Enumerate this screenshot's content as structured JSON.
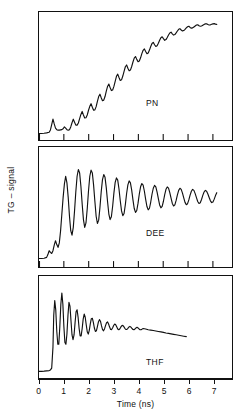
{
  "figure": {
    "ylabel": "TG – signal",
    "xlabel": "Time (ns)",
    "xticks": [
      "0",
      "1",
      "2",
      "3",
      "4",
      "5",
      "6",
      "7"
    ],
    "panels": [
      {
        "id": "pn",
        "label": "PN"
      },
      {
        "id": "dee",
        "label": "DEE"
      },
      {
        "id": "thf",
        "label": "THF"
      }
    ],
    "stroke_color": "#111111",
    "background_color": "#ffffff"
  },
  "chart_data": [
    {
      "type": "line",
      "title": "PN",
      "xlabel": "Time (ns)",
      "ylabel": "TG – signal",
      "xlim": [
        0,
        7.6
      ],
      "ylim": [
        0,
        1
      ],
      "grid": false,
      "legend": null,
      "annotations": [
        "PN"
      ],
      "description": "Transient grating signal in propionitrile: slow sigmoidal rise with superimposed damped acoustic oscillations reaching plateau near 6 ns.",
      "oscillation_period_ns": 0.33,
      "series": [
        {
          "name": "PN",
          "x": [
            0.0,
            0.1,
            0.2,
            0.3,
            0.4,
            0.45,
            0.5,
            0.55,
            0.6,
            0.65,
            0.7,
            0.75,
            0.8,
            0.85,
            0.9,
            0.95,
            1.0,
            1.05,
            1.1,
            1.15,
            1.2,
            1.25,
            1.3,
            1.35,
            1.4,
            1.45,
            1.5,
            1.55,
            1.6,
            1.65,
            1.7,
            1.75,
            1.8,
            1.85,
            1.9,
            1.95,
            2.0,
            2.05,
            2.1,
            2.15,
            2.2,
            2.25,
            2.3,
            2.35,
            2.4,
            2.45,
            2.5,
            2.55,
            2.6,
            2.65,
            2.7,
            2.75,
            2.8,
            2.85,
            2.9,
            2.95,
            3.0,
            3.05,
            3.1,
            3.15,
            3.2,
            3.25,
            3.3,
            3.35,
            3.4,
            3.45,
            3.5,
            3.55,
            3.6,
            3.65,
            3.7,
            3.75,
            3.8,
            3.85,
            3.9,
            3.95,
            4.0,
            4.05,
            4.1,
            4.15,
            4.2,
            4.25,
            4.3,
            4.35,
            4.4,
            4.45,
            4.5,
            4.55,
            4.6,
            4.65,
            4.7,
            4.75,
            4.8,
            4.85,
            4.9,
            4.95,
            5.0,
            5.05,
            5.1,
            5.15,
            5.2,
            5.25,
            5.3,
            5.35,
            5.4,
            5.45,
            5.5,
            5.55,
            5.6,
            5.65,
            5.7,
            5.75,
            5.8,
            5.85,
            5.9,
            5.95,
            6.0,
            6.05,
            6.1,
            6.15,
            6.2,
            6.25,
            6.3,
            6.35,
            6.4,
            6.45,
            6.5,
            6.55,
            6.6,
            6.65,
            6.7,
            6.75,
            6.8,
            6.85,
            6.9,
            6.95,
            7.0,
            7.05,
            7.1
          ],
          "y": [
            0.03,
            0.03,
            0.032,
            0.035,
            0.04,
            0.06,
            0.105,
            0.15,
            0.11,
            0.075,
            0.062,
            0.058,
            0.058,
            0.06,
            0.062,
            0.07,
            0.085,
            0.075,
            0.062,
            0.058,
            0.062,
            0.085,
            0.12,
            0.15,
            0.125,
            0.1,
            0.1,
            0.118,
            0.155,
            0.19,
            0.215,
            0.185,
            0.16,
            0.162,
            0.185,
            0.225,
            0.258,
            0.28,
            0.25,
            0.225,
            0.228,
            0.255,
            0.3,
            0.34,
            0.36,
            0.33,
            0.305,
            0.31,
            0.34,
            0.385,
            0.425,
            0.445,
            0.415,
            0.39,
            0.395,
            0.425,
            0.468,
            0.51,
            0.528,
            0.5,
            0.475,
            0.48,
            0.512,
            0.552,
            0.59,
            0.605,
            0.578,
            0.556,
            0.562,
            0.592,
            0.63,
            0.662,
            0.676,
            0.652,
            0.632,
            0.638,
            0.665,
            0.7,
            0.728,
            0.74,
            0.718,
            0.7,
            0.706,
            0.73,
            0.76,
            0.785,
            0.795,
            0.775,
            0.76,
            0.766,
            0.788,
            0.812,
            0.834,
            0.842,
            0.826,
            0.812,
            0.818,
            0.836,
            0.856,
            0.874,
            0.88,
            0.866,
            0.856,
            0.86,
            0.874,
            0.89,
            0.904,
            0.91,
            0.898,
            0.89,
            0.894,
            0.904,
            0.916,
            0.926,
            0.93,
            0.92,
            0.914,
            0.916,
            0.924,
            0.932,
            0.94,
            0.942,
            0.934,
            0.93,
            0.932,
            0.938,
            0.944,
            0.95,
            0.95,
            0.944,
            0.94,
            0.942,
            0.946,
            0.95,
            0.952,
            0.948,
            0.946
          ]
        }
      ]
    },
    {
      "type": "line",
      "title": "DEE",
      "xlabel": "Time (ns)",
      "ylabel": "TG – signal",
      "xlim": [
        0,
        7.6
      ],
      "ylim": [
        0,
        1
      ],
      "grid": false,
      "legend": null,
      "annotations": [
        "DEE"
      ],
      "description": "Transient grating signal in diethyl ether: fast rise near 0.8 ns to a large-amplitude oscillatory plateau with slowly damping acoustic oscillations persisting to 7 ns.",
      "oscillation_period_ns": 0.33,
      "series": [
        {
          "name": "DEE",
          "x": [
            0.0,
            0.1,
            0.2,
            0.3,
            0.35,
            0.4,
            0.45,
            0.5,
            0.55,
            0.6,
            0.65,
            0.7,
            0.75,
            0.8,
            0.85,
            0.9,
            0.95,
            1.0,
            1.05,
            1.1,
            1.15,
            1.2,
            1.25,
            1.3,
            1.35,
            1.4,
            1.45,
            1.5,
            1.55,
            1.6,
            1.65,
            1.7,
            1.75,
            1.8,
            1.85,
            1.9,
            1.95,
            2.0,
            2.05,
            2.1,
            2.15,
            2.2,
            2.25,
            2.3,
            2.35,
            2.4,
            2.45,
            2.5,
            2.55,
            2.6,
            2.65,
            2.7,
            2.75,
            2.8,
            2.85,
            2.9,
            2.95,
            3.0,
            3.05,
            3.1,
            3.15,
            3.2,
            3.25,
            3.3,
            3.35,
            3.4,
            3.45,
            3.5,
            3.55,
            3.6,
            3.65,
            3.7,
            3.75,
            3.8,
            3.85,
            3.9,
            3.95,
            4.0,
            4.05,
            4.1,
            4.15,
            4.2,
            4.25,
            4.3,
            4.35,
            4.4,
            4.45,
            4.5,
            4.55,
            4.6,
            4.65,
            4.7,
            4.75,
            4.8,
            4.85,
            4.9,
            4.95,
            5.0,
            5.05,
            5.1,
            5.15,
            5.2,
            5.25,
            5.3,
            5.35,
            5.4,
            5.45,
            5.5,
            5.55,
            5.6,
            5.65,
            5.7,
            5.75,
            5.8,
            5.85,
            5.9,
            5.95,
            6.0,
            6.05,
            6.1,
            6.15,
            6.2,
            6.25,
            6.3,
            6.35,
            6.4,
            6.45,
            6.5,
            6.55,
            6.6,
            6.65,
            6.7,
            6.75,
            6.8,
            6.85,
            6.9,
            6.95,
            7.0,
            7.05
          ],
          "y": [
            0.05,
            0.05,
            0.052,
            0.06,
            0.085,
            0.12,
            0.105,
            0.095,
            0.12,
            0.17,
            0.21,
            0.175,
            0.15,
            0.19,
            0.3,
            0.45,
            0.6,
            0.72,
            0.79,
            0.73,
            0.6,
            0.43,
            0.3,
            0.26,
            0.33,
            0.48,
            0.65,
            0.79,
            0.85,
            0.82,
            0.7,
            0.54,
            0.4,
            0.33,
            0.37,
            0.5,
            0.66,
            0.79,
            0.845,
            0.82,
            0.71,
            0.565,
            0.43,
            0.365,
            0.395,
            0.51,
            0.65,
            0.76,
            0.805,
            0.78,
            0.685,
            0.56,
            0.45,
            0.4,
            0.425,
            0.52,
            0.64,
            0.735,
            0.775,
            0.755,
            0.675,
            0.57,
            0.478,
            0.435,
            0.455,
            0.535,
            0.635,
            0.712,
            0.748,
            0.73,
            0.665,
            0.578,
            0.5,
            0.465,
            0.482,
            0.548,
            0.63,
            0.695,
            0.725,
            0.71,
            0.655,
            0.582,
            0.518,
            0.488,
            0.502,
            0.558,
            0.628,
            0.682,
            0.708,
            0.695,
            0.648,
            0.588,
            0.532,
            0.506,
            0.518,
            0.565,
            0.625,
            0.672,
            0.694,
            0.683,
            0.643,
            0.592,
            0.545,
            0.522,
            0.532,
            0.572,
            0.622,
            0.663,
            0.682,
            0.672,
            0.638,
            0.595,
            0.555,
            0.534,
            0.543,
            0.577,
            0.62,
            0.655,
            0.672,
            0.663,
            0.634,
            0.598,
            0.563,
            0.545,
            0.552,
            0.581,
            0.618,
            0.648,
            0.663,
            0.655,
            0.63,
            0.599,
            0.569,
            0.553,
            0.559,
            0.584,
            0.616,
            0.642
          ]
        }
      ]
    },
    {
      "type": "line",
      "title": "THF",
      "xlabel": "Time (ns)",
      "ylabel": "TG – signal",
      "xlim": [
        0,
        7.6
      ],
      "ylim": [
        0,
        1
      ],
      "grid": false,
      "legend": null,
      "annotations": [
        "THF"
      ],
      "description": "Transient grating signal in tetrahydrofuran: very fast rise at 0.6 ns followed by strongly damped acoustic oscillations that decay into a slowly declining baseline by about 5.8 ns.",
      "oscillation_period_ns": 0.3,
      "series": [
        {
          "name": "THF",
          "x": [
            0.0,
            0.1,
            0.2,
            0.3,
            0.4,
            0.45,
            0.5,
            0.55,
            0.58,
            0.62,
            0.66,
            0.7,
            0.74,
            0.78,
            0.82,
            0.86,
            0.9,
            0.94,
            0.98,
            1.02,
            1.06,
            1.1,
            1.14,
            1.18,
            1.22,
            1.26,
            1.3,
            1.34,
            1.38,
            1.42,
            1.46,
            1.5,
            1.54,
            1.58,
            1.62,
            1.66,
            1.7,
            1.74,
            1.78,
            1.82,
            1.86,
            1.9,
            1.94,
            1.98,
            2.02,
            2.06,
            2.1,
            2.14,
            2.18,
            2.22,
            2.26,
            2.3,
            2.34,
            2.38,
            2.42,
            2.46,
            2.5,
            2.54,
            2.58,
            2.62,
            2.66,
            2.7,
            2.74,
            2.78,
            2.82,
            2.86,
            2.9,
            2.94,
            2.98,
            3.02,
            3.06,
            3.1,
            3.14,
            3.18,
            3.22,
            3.26,
            3.3,
            3.34,
            3.38,
            3.42,
            3.46,
            3.5,
            3.54,
            3.58,
            3.62,
            3.66,
            3.7,
            3.74,
            3.78,
            3.82,
            3.86,
            3.9,
            3.94,
            3.98,
            4.02,
            4.06,
            4.1,
            4.2,
            4.3,
            4.4,
            4.5,
            4.6,
            4.7,
            4.8,
            4.9,
            5.0,
            5.1,
            5.2,
            5.3,
            5.4,
            5.5,
            5.6,
            5.7,
            5.8
          ],
          "y": [
            0.04,
            0.04,
            0.042,
            0.045,
            0.048,
            0.055,
            0.075,
            0.3,
            0.64,
            0.8,
            0.7,
            0.47,
            0.33,
            0.33,
            0.52,
            0.76,
            0.88,
            0.76,
            0.52,
            0.35,
            0.33,
            0.44,
            0.64,
            0.78,
            0.74,
            0.58,
            0.43,
            0.38,
            0.43,
            0.56,
            0.68,
            0.7,
            0.62,
            0.5,
            0.42,
            0.42,
            0.5,
            0.6,
            0.655,
            0.62,
            0.54,
            0.465,
            0.44,
            0.48,
            0.55,
            0.605,
            0.61,
            0.565,
            0.505,
            0.468,
            0.475,
            0.52,
            0.57,
            0.595,
            0.578,
            0.53,
            0.49,
            0.475,
            0.495,
            0.53,
            0.562,
            0.57,
            0.548,
            0.515,
            0.49,
            0.488,
            0.508,
            0.532,
            0.548,
            0.54,
            0.518,
            0.495,
            0.486,
            0.495,
            0.514,
            0.53,
            0.533,
            0.52,
            0.502,
            0.489,
            0.49,
            0.502,
            0.516,
            0.522,
            0.514,
            0.5,
            0.489,
            0.487,
            0.495,
            0.506,
            0.512,
            0.506,
            0.495,
            0.486,
            0.486,
            0.493,
            0.5,
            0.494,
            0.486,
            0.482,
            0.478,
            0.473,
            0.468,
            0.463,
            0.458,
            0.452,
            0.447,
            0.442,
            0.437,
            0.432,
            0.427,
            0.422,
            0.417,
            0.412
          ]
        }
      ]
    }
  ]
}
